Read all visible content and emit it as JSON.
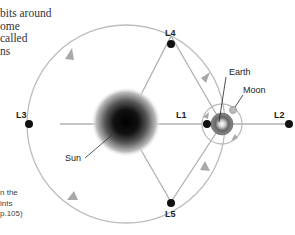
{
  "intro_text": {
    "lines": [
      "bits around",
      "ome",
      "called",
      "ns"
    ]
  },
  "caption": {
    "lines": [
      "n the",
      "ints",
      "p.105)"
    ]
  },
  "labels": {
    "l1": "L1",
    "l2": "L2",
    "l3": "L3",
    "l4": "L4",
    "l5": "L5",
    "sun": "Sun",
    "earth": "Earth",
    "moon": "Moon"
  },
  "colors": {
    "orbit": "#bdbdbd",
    "line": "#b0b0b0",
    "arrow": "#a9a9a9",
    "point": "#111111",
    "sun_core": "#111111",
    "earth": "#6e6e6e"
  }
}
